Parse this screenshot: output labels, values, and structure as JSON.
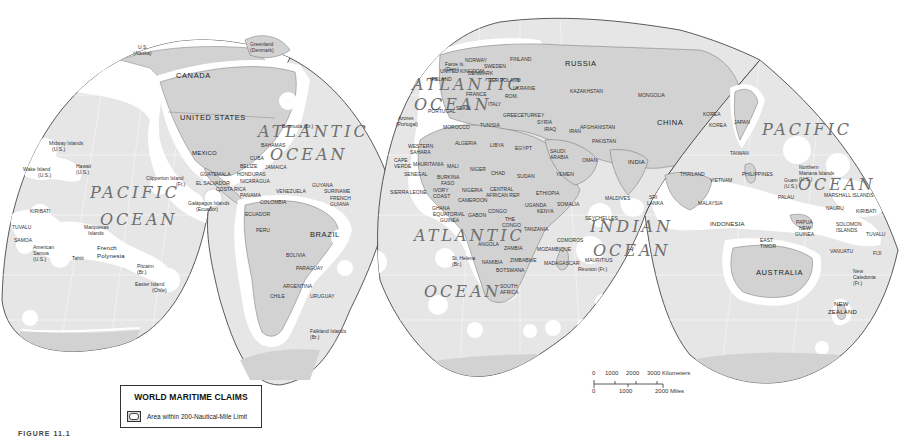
{
  "legend": {
    "title": "WORLD MARITIME CLAIMS",
    "item_label": "Area within 200-Nautical-Mile Limit"
  },
  "caption": "FIGURE 11.1",
  "scale_bar": {
    "km_ticks": [
      "0",
      "1000",
      "2000",
      "3000 Kilometers"
    ],
    "mile_ticks": [
      "0",
      "1000",
      "2000 Miles"
    ]
  },
  "colors": {
    "land": "#d0d0d0",
    "ocean": "#e8e8e8",
    "eez": "#ffffff",
    "outline": "#333333"
  },
  "oceans": {
    "pacific_west_1": "PACIFIC",
    "pacific_west_2": "OCEAN",
    "atlantic_north_1": "ATLANTIC",
    "atlantic_north_2": "OCEAN",
    "atlantic_north_east_1": "ATLANTIC",
    "atlantic_north_east_2": "OCEAN",
    "atlantic_south_1": "ATLANTIC",
    "atlantic_south_2": "OCEAN",
    "indian_1": "INDIAN",
    "indian_2": "OCEAN",
    "pacific_east_1": "PACIFIC",
    "pacific_east_2": "OCEAN"
  },
  "countries": {
    "canada": "CANADA",
    "usa": "UNITED STATES",
    "mexico": "MEXICO",
    "alaska_1": "U.S.",
    "alaska_2": "(Alaska)",
    "greenland_1": "Greenland",
    "greenland_2": "(Denmark)",
    "bahamas": "BAHAMAS",
    "cuba": "CUBA",
    "jamaica": "JAMAICA",
    "belize": "BELIZE",
    "guatemala": "GUATEMALA",
    "honduras": "HONDURAS",
    "el_salvador": "EL SALVADOR",
    "nicaragua": "NICARAGUA",
    "costa_rica": "COSTA RICA",
    "panama": "PANAMA",
    "venezuela": "VENEZUELA",
    "colombia": "COLOMBIA",
    "ecuador": "ECUADOR",
    "peru": "PERU",
    "brazil": "BRAZIL",
    "bolivia": "BOLIVIA",
    "paraguay": "PARAGUAY",
    "argentina": "ARGENTINA",
    "chile": "CHILE",
    "uruguay": "URUGUAY",
    "guyana": "GUYANA",
    "suriname": "SURINAME",
    "french_guiana_1": "FRENCH",
    "french_guiana_2": "GUIANA",
    "russia": "RUSSIA",
    "finland": "FINLAND",
    "sweden": "SWEDEN",
    "norway": "NORWAY",
    "denmark": "DENMARK",
    "uk": "UNITED KINGDOM",
    "ireland": "IRELAND",
    "germany": "GER.",
    "poland": "POLAND",
    "ukraine": "UKRAINE",
    "france": "FRANCE",
    "spain": "SPAIN",
    "portugal": "PORTUGAL",
    "italy": "ITALY",
    "romania": "ROM.",
    "greece": "GREECE",
    "turkey": "TURKEY",
    "syria": "SYRIA",
    "iraq": "IRAQ",
    "iran": "IRAN",
    "kazakhstan": "KAZAKHSTAN",
    "mongolia": "MONGOLIA",
    "china": "CHINA",
    "afghanistan": "AFGHANISTAN",
    "pakistan": "PAKISTAN",
    "india": "INDIA",
    "saudi_arabia_1": "SAUDI",
    "saudi_arabia_2": "ARABIA",
    "oman": "OMAN",
    "yemen": "YEMEN",
    "korea_n": "KOREA",
    "korea_s": "KOREA",
    "japan": "JAPAN",
    "taiwan": "TAIWAN",
    "thailand": "THAILAND",
    "vietnam": "VIETNAM",
    "philippines": "PHILIPPINES",
    "malaysia": "MALAYSIA",
    "indonesia": "INDONESIA",
    "sri_lanka_1": "SRI",
    "sri_lanka_2": "LANKA",
    "maldives": "MALDIVES",
    "morocco": "MOROCCO",
    "tunisia": "TUNISIA",
    "algeria": "ALGERIA",
    "libya": "LIBYA",
    "egypt": "EGYPT",
    "western_sahara_1": "WESTERN",
    "western_sahara_2": "SAHARA",
    "mauritania": "MAURITANIA",
    "mali": "MALI",
    "niger": "NIGER",
    "chad": "CHAD",
    "sudan": "SUDAN",
    "senegal": "SENEGAL",
    "cape_verde_1": "CAPE",
    "cape_verde_2": "VERDE",
    "burkina_1": "BURKINA",
    "burkina_2": "FASO",
    "sierra_leone": "SIERRA LEONE",
    "ivory_coast_1": "IVORY",
    "ivory_coast_2": "COAST",
    "nigeria": "NIGERIA",
    "ghana": "GHANA",
    "cameroon": "CAMEROON",
    "car_1": "CENTRAL",
    "car_2": "AFRICAN REP.",
    "ethiopia": "ETHIOPIA",
    "somalia": "SOMALIA",
    "eq_guinea_1": "EQUATORIAL",
    "eq_guinea_2": "GUINEA",
    "gabon": "GABON",
    "congo": "CONGO",
    "drc_1": "THE",
    "drc_2": "CONGO",
    "uganda": "UGANDA",
    "kenya": "KENYA",
    "tanzania": "TANZANIA",
    "angola": "ANGOLA",
    "zambia": "ZAMBIA",
    "mozambique": "MOZAMBIQUE",
    "comoros": "COMOROS",
    "madagascar": "MADAGASCAR",
    "namibia": "NAMIBIA",
    "zimbabwe": "ZIMBABWE",
    "botswana": "BOTSWANA",
    "south_africa_1": "SOUTH",
    "south_africa_2": "AFRICA",
    "seychelles": "SEYCHELLES",
    "mauritius": "MAURITIUS",
    "australia": "AUSTRALIA",
    "new_zealand_1": "NEW",
    "new_zealand_2": "ZEALAND",
    "png_1": "PAPUA",
    "png_2": "NEW",
    "png_3": "GUINEA",
    "east_timor_1": "EAST",
    "east_timor_2": "TIMOR",
    "palau": "PALAU",
    "marshall_islands": "MARSHALL ISLANDS",
    "nauru": "NAURU",
    "kiribati_e": "KIRIBATI",
    "solomon_1": "SOLOMON",
    "solomon_2": "ISLANDS",
    "tuvalu_e": "TUVALU",
    "vanuatu": "VANUATU",
    "fiji": "FIJI",
    "kiribati_w": "KIRIBATI",
    "tuvalu_w": "TUVALU",
    "samoa": "SAMOA"
  },
  "territories": {
    "midway_1": "Midway Islands",
    "midway_2": "(U.S.)",
    "wake_1": "Wake Island",
    "wake_2": "(U.S.)",
    "hawaii_1": "Hawaii",
    "hawaii_2": "(U.S.)",
    "clipperton_1": "Clipperton Island",
    "clipperton_2": "(Fr.)",
    "galapagos_1": "Galápagos Islands",
    "galapagos_2": "(Ecuador)",
    "marquesas_1": "Marquesas",
    "marquesas_2": "Islands",
    "american_samoa_1": "American",
    "american_samoa_2": "Samoa",
    "american_samoa_3": "(U.S.)",
    "tahiti": "Tahiti",
    "french_polynesia_1": "French",
    "french_polynesia_2": "Polynesia",
    "pitcairn_1": "Pitcairn",
    "pitcairn_2": "(Br.)",
    "easter_1": "Easter Island",
    "easter_2": "(Chile)",
    "bermuda": "Bermuda (Br.)",
    "falkland_1": "Falkland Islands",
    "falkland_2": "(Br.)",
    "azores_1": "Azores",
    "azores_2": "(Portugal)",
    "faroe_1": "Faroe Is.",
    "faroe_2": "(Den.)",
    "st_helena_1": "St. Helena",
    "st_helena_2": "(Br.)",
    "reunion": "Réunion (Fr.)",
    "n_mariana_1": "Northern",
    "n_mariana_2": "Mariana Islands",
    "n_mariana_3": "(U.S.)",
    "guam_1": "Guam",
    "guam_2": "(U.S.)",
    "new_caledonia_1": "New",
    "new_caledonia_2": "Caledonia",
    "new_caledonia_3": "(Fr.)"
  }
}
